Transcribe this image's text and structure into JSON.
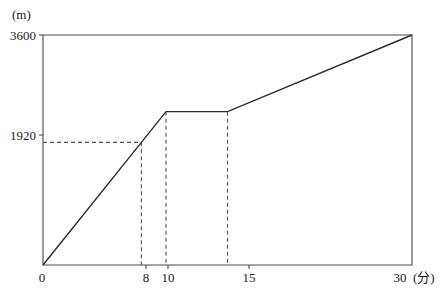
{
  "chart_data": {
    "type": "line",
    "title": "",
    "subtitle": "",
    "xlabel": "(分)",
    "ylabel": "(m)",
    "x": [
      0,
      8,
      10,
      15,
      30
    ],
    "values": [
      0,
      1920,
      2400,
      2400,
      3600
    ],
    "series": [
      {
        "name": "distance",
        "x": [
          0,
          8,
          10,
          15,
          30
        ],
        "values": [
          0,
          1920,
          2400,
          2400,
          3600
        ]
      }
    ],
    "xlim": [
      0,
      30
    ],
    "ylim": [
      0,
      3600
    ],
    "xticks": [
      0,
      8,
      10,
      15,
      30
    ],
    "yticks": [
      1920,
      3600
    ],
    "xtick_labels": [
      "0",
      "8",
      "10",
      "15",
      "30"
    ],
    "ytick_labels": [
      "1920",
      "3600"
    ],
    "grid": false,
    "legend": "none",
    "annotations": [
      {
        "kind": "dashed-horizontal",
        "y": 1920,
        "from_x": 0,
        "to_x": 8
      },
      {
        "kind": "dashed-vertical",
        "x": 8,
        "from_y": 0,
        "to_y": 1920
      },
      {
        "kind": "dashed-vertical",
        "x": 10,
        "from_y": 0,
        "to_y": 2400
      },
      {
        "kind": "dashed-vertical",
        "x": 15,
        "from_y": 0,
        "to_y": 2400
      }
    ]
  },
  "axes": {
    "y_unit": "(m)",
    "x_unit": "(分)",
    "y_top_label": "3600",
    "y_mid_label": "1920",
    "x_origin_label": "0",
    "x_label_8": "8",
    "x_label_10": "10",
    "x_label_15": "15",
    "x_label_30": "30"
  },
  "style": {
    "line_color": "#2b2b2b",
    "frame_color": "#4a4a4a",
    "dash_color": "#555555",
    "background": "#ffffff",
    "text_color": "#1a1a1a"
  }
}
